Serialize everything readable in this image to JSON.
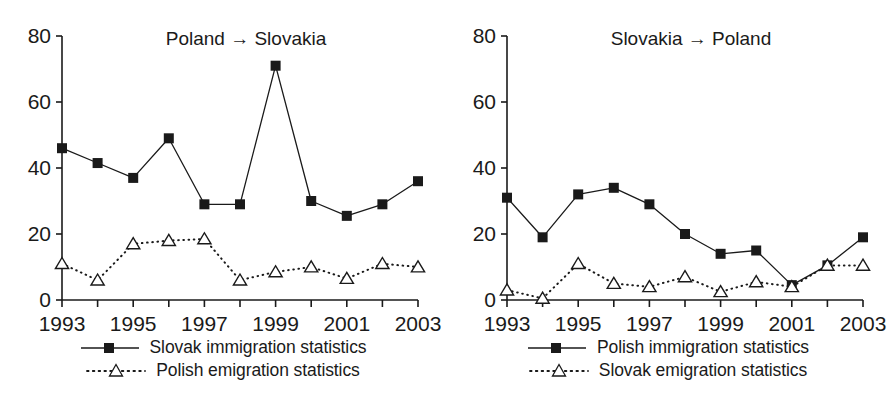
{
  "figure": {
    "background_color": "#ffffff",
    "ink_color": "#1a1a1a"
  },
  "panels": [
    {
      "id": "poland-to-slovakia",
      "title": "Poland → Slovakia",
      "legend": [
        {
          "label": "Slovak immigration statistics",
          "marker": "filled-square",
          "line": "solid"
        },
        {
          "label": "Polish emigration statistics",
          "marker": "open-triangle",
          "line": "dotted"
        }
      ]
    },
    {
      "id": "slovakia-to-poland",
      "title": "Slovakia → Poland",
      "legend": [
        {
          "label": "Polish immigration statistics",
          "marker": "filled-square",
          "line": "solid"
        },
        {
          "label": "Slovak emigration statistics",
          "marker": "open-triangle",
          "line": "dotted"
        }
      ]
    }
  ],
  "chart_data": [
    {
      "type": "line",
      "title": "Poland → Slovakia",
      "xlabel": "",
      "ylabel": "",
      "x": [
        1993,
        1994,
        1995,
        1996,
        1997,
        1998,
        1999,
        2000,
        2001,
        2002,
        2003
      ],
      "xtick_labels": [
        "1993",
        "1995",
        "1997",
        "1999",
        "2001",
        "2003"
      ],
      "xticks": [
        1993,
        1995,
        1997,
        1999,
        2001,
        2003
      ],
      "xlim": [
        1993,
        2003
      ],
      "ytick_labels": [
        "0",
        "20",
        "40",
        "60",
        "80"
      ],
      "yticks": [
        0,
        20,
        40,
        60,
        80
      ],
      "ylim": [
        0,
        80
      ],
      "grid": false,
      "legend_position": "below",
      "series": [
        {
          "name": "Slovak immigration statistics",
          "marker": "filled-square",
          "line": "solid",
          "values": [
            46,
            41.5,
            37,
            49,
            29,
            29,
            71,
            30,
            25.5,
            29,
            36
          ]
        },
        {
          "name": "Polish emigration statistics",
          "marker": "open-triangle",
          "line": "dotted",
          "values": [
            11,
            6,
            17,
            18,
            18.5,
            6,
            8.5,
            10,
            6.5,
            11,
            10
          ]
        }
      ]
    },
    {
      "type": "line",
      "title": "Slovakia → Poland",
      "xlabel": "",
      "ylabel": "",
      "x": [
        1993,
        1994,
        1995,
        1996,
        1997,
        1998,
        1999,
        2000,
        2001,
        2002,
        2003
      ],
      "xtick_labels": [
        "1993",
        "1995",
        "1997",
        "1999",
        "2001",
        "2003"
      ],
      "xticks": [
        1993,
        1995,
        1997,
        1999,
        2001,
        2003
      ],
      "xlim": [
        1993,
        2003
      ],
      "ytick_labels": [
        "0",
        "20",
        "40",
        "60",
        "80"
      ],
      "yticks": [
        0,
        20,
        40,
        60,
        80
      ],
      "ylim": [
        0,
        80
      ],
      "grid": false,
      "legend_position": "below",
      "series": [
        {
          "name": "Polish immigration statistics",
          "marker": "filled-square",
          "line": "solid",
          "values": [
            31,
            19,
            32,
            34,
            29,
            20,
            14,
            15,
            4.5,
            10.5,
            19
          ]
        },
        {
          "name": "Slovak emigration statistics",
          "marker": "open-triangle",
          "line": "dotted",
          "values": [
            3,
            0.5,
            11,
            5,
            4,
            7,
            2.5,
            5.5,
            4,
            10.5,
            10.5
          ]
        }
      ]
    }
  ]
}
